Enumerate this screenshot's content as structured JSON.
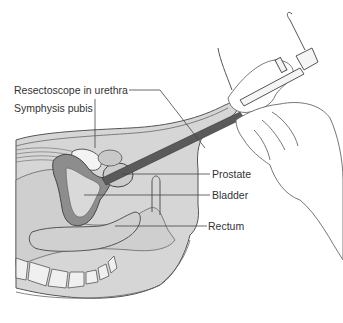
{
  "figure": {
    "labels": [
      {
        "id": "resectoscope",
        "text": "Resectoscope in urethra"
      },
      {
        "id": "symphysis",
        "text": "Symphysis pubis"
      },
      {
        "id": "prostate",
        "text": "Prostate"
      },
      {
        "id": "bladder",
        "text": "Bladder"
      },
      {
        "id": "rectum",
        "text": "Rectum"
      }
    ],
    "colors": {
      "tissue_light": "#d4d4d4",
      "tissue_mid": "#bdbdbd",
      "bladder_wall": "#8a8a8a",
      "scope": "#5a5a5a",
      "outline": "#555555",
      "bone": "#f2f2f2"
    }
  }
}
